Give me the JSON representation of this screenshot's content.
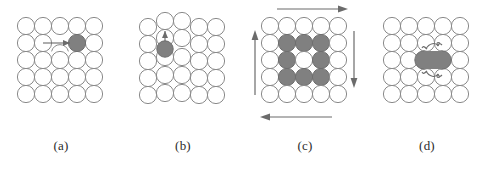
{
  "figure": {
    "background": "#ffffff",
    "atom_fill": "#ffffff",
    "atom_stroke": "#8a8a8a",
    "defect_fill": "#808080",
    "defect_stroke": "#6e6e6e",
    "arrow_color": "#6b6b6b",
    "caption_color": "#2b2b2b"
  },
  "panels": [
    {
      "id": "panel-a",
      "caption": "(a)",
      "mechanism": "vacancy",
      "grid": {
        "rows": 5,
        "cols": 5
      },
      "vacancy": {
        "row": 2,
        "col": 3
      },
      "defect_atoms": [
        {
          "row": 2,
          "col": 4,
          "type": "substitutional"
        }
      ],
      "arrows": [
        {
          "type": "straight",
          "direction": "left",
          "from_col": 4,
          "to_col": 3,
          "row": 2
        }
      ]
    },
    {
      "id": "panel-b",
      "caption": "(b)",
      "mechanism": "interstitial",
      "grid": {
        "rows": 5,
        "cols": 5
      },
      "defect_atoms": [
        {
          "row": 2,
          "col": 2,
          "type": "interstitial"
        }
      ],
      "arrows": [
        {
          "type": "straight",
          "direction": "up",
          "col": 2,
          "from_row": 2,
          "to_row": 1
        }
      ]
    },
    {
      "id": "panel-c",
      "caption": "(c)",
      "mechanism": "ring-rotation",
      "grid": {
        "rows": 5,
        "cols": 5
      },
      "shaded_block": {
        "rows": [
          2,
          3,
          4
        ],
        "cols": [
          2,
          3,
          4
        ],
        "hollow_center": true
      },
      "arrows": [
        {
          "type": "straight",
          "direction": "right",
          "position": "top"
        },
        {
          "type": "straight",
          "direction": "down",
          "position": "right"
        },
        {
          "type": "straight",
          "direction": "left",
          "position": "bottom"
        },
        {
          "type": "straight",
          "direction": "up",
          "position": "left"
        }
      ]
    },
    {
      "id": "panel-d",
      "caption": "(d)",
      "mechanism": "interstitialcy-dumbbell",
      "grid": {
        "rows": 5,
        "cols": 5
      },
      "defect_atoms": [
        {
          "row": 3,
          "col": 3,
          "type": "dumbbell"
        },
        {
          "row": 3,
          "col": 4,
          "type": "dumbbell"
        }
      ],
      "arrows": [
        {
          "type": "curved",
          "position": "above-dumbbell"
        },
        {
          "type": "curved",
          "position": "below-dumbbell"
        }
      ]
    }
  ]
}
